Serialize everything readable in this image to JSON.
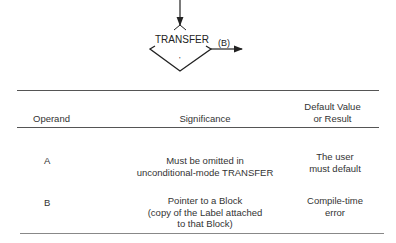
{
  "diagram": {
    "block_label": "TRANSFER",
    "operand_label": "(B)",
    "center_mark": "'"
  },
  "table": {
    "headers": {
      "operand": "Operand",
      "significance": "Significance",
      "default": "Default Value\nor Result"
    },
    "rows": [
      {
        "operand": "A",
        "significance": "Must be omitted in\nunconditional-mode TRANSFER",
        "default": "The user\nmust default"
      },
      {
        "operand": "B",
        "significance": "Pointer to a Block\n(copy of the Label attached\nto that Block)",
        "default": "Compile-time\nerror"
      }
    ]
  }
}
